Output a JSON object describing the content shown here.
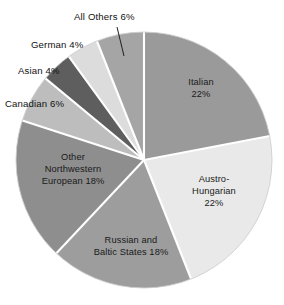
{
  "chart_data": {
    "type": "pie",
    "title": "",
    "subtitle": "",
    "xlabel": "",
    "ylabel": "",
    "legend_position": "none",
    "grid": false,
    "units": "percent",
    "total": 100,
    "start_angle_deg": 0,
    "direction": "clockwise",
    "categories": [
      "Italian",
      "Austro-Hungarian",
      "Russian and Baltic States",
      "Other Northwestern European",
      "Canadian",
      "Asian",
      "German",
      "All Others"
    ],
    "values": [
      22,
      22,
      18,
      18,
      6,
      4,
      4,
      6
    ],
    "slices": [
      {
        "name": "Italian",
        "value": 22,
        "label_lines": [
          "Italian",
          "22%"
        ],
        "label_text": "Italian 22%",
        "color": "#9a9a9a",
        "label_placement": "inside",
        "label_x": 201,
        "label_y": 85,
        "has_leader": false
      },
      {
        "name": "Austro-Hungarian",
        "value": 22,
        "label_lines": [
          "Austro-",
          "Hungarian",
          "22%"
        ],
        "label_text": "Austro-Hungarian 22%",
        "color": "#e9e9e9",
        "label_placement": "inside",
        "label_x": 214,
        "label_y": 182,
        "has_leader": false
      },
      {
        "name": "Russian and Baltic States",
        "value": 18,
        "label_lines": [
          "Russian and",
          "Baltic States 18%"
        ],
        "label_text": "Russian and Baltic States 18%",
        "color": "#9d9d9d",
        "label_placement": "inside",
        "label_x": 131,
        "label_y": 243,
        "has_leader": false
      },
      {
        "name": "Other Northwestern European",
        "value": 18,
        "label_lines": [
          "Other",
          "Northwestern",
          "European 18%"
        ],
        "label_text": "Other Northwestern European 18%",
        "color": "#8e8e8e",
        "label_placement": "inside",
        "label_x": 73,
        "label_y": 160,
        "has_leader": false
      },
      {
        "name": "Canadian",
        "value": 6,
        "label_lines": [
          "Canadian 6%"
        ],
        "label_text": "Canadian 6%",
        "color": "#bdbdbd",
        "label_placement": "outside",
        "label_x": 5,
        "label_y": 107,
        "has_leader": false
      },
      {
        "name": "Asian",
        "value": 4,
        "label_lines": [
          "Asian 4%"
        ],
        "label_text": "Asian 4%",
        "color": "#5e5e5e",
        "label_placement": "outside",
        "label_x": 18,
        "label_y": 74,
        "has_leader": false
      },
      {
        "name": "German",
        "value": 4,
        "label_lines": [
          "German 4%"
        ],
        "label_text": "German 4%",
        "color": "#dcdcdc",
        "label_placement": "outside",
        "label_x": 31,
        "label_y": 48,
        "has_leader": false
      },
      {
        "name": "All Others",
        "value": 6,
        "label_lines": [
          "All Others 6%"
        ],
        "label_text": "All Others 6%",
        "color": "#a5a5a5",
        "label_placement": "outside",
        "label_x": 74,
        "label_y": 20,
        "has_leader": true,
        "leader": {
          "x1": 117,
          "y1": 27,
          "x2": 124,
          "y2": 56
        }
      }
    ],
    "geometry": {
      "center_x": 144,
      "center_y": 160,
      "radius": 128,
      "separator_color": "#ffffff",
      "background": "#ffffff"
    }
  }
}
